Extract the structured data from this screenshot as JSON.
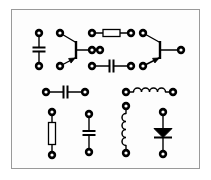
{
  "figure": {
    "type": "schematic-diagram",
    "canvas": {
      "width": 211,
      "height": 180
    },
    "colors": {
      "background": "#ffffff",
      "panel": "#fdfdfd",
      "frame": "#9a9a9a",
      "ink": "#000000",
      "component_fill": "#ffffff",
      "node_ring": "#000000"
    },
    "frame": {
      "x": 11,
      "y": 9,
      "width": 189,
      "height": 160,
      "stroke_width": 1
    },
    "node_style": {
      "outer_radius": 4.2,
      "inner_radius": 1.6
    },
    "wire_width": 1.4
  },
  "components": [
    {
      "id": "c1",
      "name": "capacitor-top-left",
      "type": "capacitor",
      "orientation": "vertical",
      "x": 39,
      "y1": 33,
      "y2": 66,
      "plate_half_width": 6.5,
      "plate_gap": 4
    },
    {
      "id": "q1",
      "name": "transistor-left",
      "type": "transistor-npn",
      "base_x": 76,
      "base_y_top": 41,
      "base_y_bottom": 59,
      "collector_node": {
        "x": 60,
        "y": 33
      },
      "emitter_node": {
        "x": 60,
        "y": 66
      },
      "lead_node": {
        "x": 100,
        "y": 50
      },
      "arrow_on": "emitter"
    },
    {
      "id": "r1",
      "name": "resistor-top-middle",
      "type": "resistor",
      "orientation": "horizontal",
      "y": 33,
      "x1": 92,
      "x2": 131,
      "body_length": 17,
      "body_thickness": 7
    },
    {
      "id": "c2",
      "name": "capacitor-middle",
      "type": "capacitor",
      "orientation": "horizontal",
      "y": 66,
      "x1": 92,
      "x2": 131,
      "plate_half_height": 6.5,
      "plate_gap": 4
    },
    {
      "id": "n-mid-left",
      "name": "node-middle-left",
      "type": "node",
      "x": 92,
      "y": 50
    },
    {
      "id": "q2",
      "name": "transistor-right",
      "type": "transistor-npn",
      "base_x": 160,
      "base_y_top": 41,
      "base_y_bottom": 59,
      "collector_node": {
        "x": 143,
        "y": 33
      },
      "emitter_node": {
        "x": 143,
        "y": 66
      },
      "lead_node": {
        "x": 181,
        "y": 50
      },
      "arrow_on": "emitter"
    },
    {
      "id": "c3",
      "name": "capacitor-lower-left",
      "type": "capacitor",
      "orientation": "horizontal",
      "y": 92,
      "x1": 46,
      "x2": 85,
      "plate_half_height": 6.5,
      "plate_gap": 4
    },
    {
      "id": "l1",
      "name": "inductor-horizontal",
      "type": "inductor",
      "orientation": "horizontal",
      "y": 92,
      "x1": 126,
      "x2": 173,
      "coil_count": 4,
      "coil_radius": 4
    },
    {
      "id": "r2",
      "name": "resistor-bottom-left",
      "type": "resistor",
      "orientation": "vertical",
      "x": 52,
      "y1": 112,
      "y2": 155,
      "body_length": 22,
      "body_thickness": 7
    },
    {
      "id": "c4",
      "name": "capacitor-bottom-middle",
      "type": "capacitor",
      "orientation": "vertical",
      "x": 89,
      "y1": 114,
      "y2": 152,
      "plate_half_width": 6.5,
      "plate_gap": 4
    },
    {
      "id": "l2",
      "name": "inductor-vertical",
      "type": "inductor",
      "orientation": "vertical",
      "x": 126,
      "y1": 106,
      "y2": 153,
      "coil_count": 4,
      "coil_radius": 4
    },
    {
      "id": "d1",
      "name": "diode",
      "type": "diode",
      "orientation": "vertical",
      "x": 163,
      "y1": 112,
      "y2": 154,
      "triangle_half_width": 9,
      "triangle_height": 9,
      "direction": "down"
    }
  ],
  "nodes": [
    {
      "name": "node-c1-top",
      "x": 39,
      "y": 33
    },
    {
      "name": "node-c1-bottom",
      "x": 39,
      "y": 66
    },
    {
      "name": "node-q1-collector",
      "x": 60,
      "y": 33
    },
    {
      "name": "node-q1-emitter",
      "x": 60,
      "y": 66
    },
    {
      "name": "node-q1-lead",
      "x": 100,
      "y": 50
    },
    {
      "name": "node-r1-left",
      "x": 92,
      "y": 33
    },
    {
      "name": "node-r1-right",
      "x": 131,
      "y": 33
    },
    {
      "name": "node-mid-left",
      "x": 92,
      "y": 50
    },
    {
      "name": "node-c2-left",
      "x": 92,
      "y": 66
    },
    {
      "name": "node-c2-right",
      "x": 131,
      "y": 66
    },
    {
      "name": "node-q2-collector",
      "x": 143,
      "y": 33
    },
    {
      "name": "node-q2-emitter",
      "x": 143,
      "y": 66
    },
    {
      "name": "node-q2-lead",
      "x": 181,
      "y": 50
    },
    {
      "name": "node-c3-left",
      "x": 46,
      "y": 92
    },
    {
      "name": "node-c3-right",
      "x": 85,
      "y": 92
    },
    {
      "name": "node-l1-left",
      "x": 126,
      "y": 92
    },
    {
      "name": "node-l1-right",
      "x": 173,
      "y": 92
    },
    {
      "name": "node-r2-top",
      "x": 52,
      "y": 112
    },
    {
      "name": "node-r2-bottom",
      "x": 52,
      "y": 155
    },
    {
      "name": "node-c4-top",
      "x": 89,
      "y": 114
    },
    {
      "name": "node-c4-bottom",
      "x": 89,
      "y": 152
    },
    {
      "name": "node-l2-top",
      "x": 126,
      "y": 106
    },
    {
      "name": "node-l2-bottom",
      "x": 126,
      "y": 153
    },
    {
      "name": "node-d1-top",
      "x": 163,
      "y": 112
    },
    {
      "name": "node-d1-bottom",
      "x": 163,
      "y": 154
    }
  ]
}
